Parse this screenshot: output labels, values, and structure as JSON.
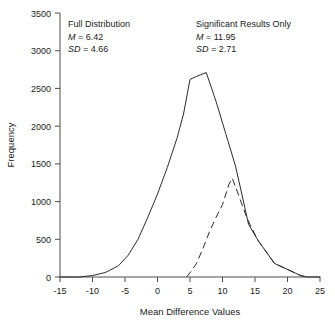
{
  "chart_data": {
    "type": "line",
    "title": "",
    "xlabel": "Mean Difference Values",
    "ylabel": "Frequency",
    "xlim": [
      -15,
      25
    ],
    "ylim": [
      0,
      3500
    ],
    "xticks": [
      "-15",
      "-10",
      "-5",
      "0",
      "5",
      "10",
      "15",
      "20",
      "25"
    ],
    "xtick_values": [
      -15,
      -10,
      -5,
      0,
      5,
      10,
      15,
      20,
      25
    ],
    "yticks": [
      "0",
      "500",
      "1000",
      "1500",
      "2000",
      "2500",
      "3000",
      "3500"
    ],
    "ytick_values": [
      0,
      500,
      1000,
      1500,
      2000,
      2500,
      3000,
      3500
    ],
    "grid": false,
    "legend_position": "none",
    "series": [
      {
        "name": "Full Distribution",
        "style": "solid",
        "x": [
          -15,
          -12,
          -10,
          -8,
          -6,
          -4.5,
          -3,
          -1.5,
          0,
          1.5,
          3,
          4,
          5,
          6,
          7.5,
          9,
          10.5,
          12,
          13,
          14,
          15.5,
          17,
          18,
          19.5,
          21,
          22,
          23,
          25
        ],
        "y": [
          0,
          0,
          20,
          60,
          150,
          290,
          500,
          790,
          1100,
          1450,
          1840,
          2160,
          2620,
          2660,
          2710,
          2330,
          1900,
          1470,
          1090,
          700,
          480,
          300,
          180,
          120,
          60,
          20,
          0,
          0
        ]
      },
      {
        "name": "Significant Results Only",
        "style": "dashed",
        "x": [
          4.5,
          5.2,
          6,
          7,
          8,
          9,
          10,
          11,
          11.5,
          12.5,
          13.5,
          14.2,
          15.5,
          17,
          18,
          19.5,
          21,
          22,
          23
        ],
        "y": [
          0,
          80,
          180,
          380,
          600,
          790,
          960,
          1230,
          1310,
          1080,
          840,
          700,
          480,
          300,
          180,
          120,
          60,
          20,
          0
        ]
      }
    ],
    "annotations": [
      {
        "id": "full-distribution",
        "heading": "Full Distribution",
        "mean_label": "M",
        "mean_eq": " = 6.42",
        "sd_label": "SD",
        "sd_eq": " = 4.66"
      },
      {
        "id": "significant-results-only",
        "heading": "Significant Results Only",
        "mean_label": "M",
        "mean_eq": " = 11.95",
        "sd_label": "SD",
        "sd_eq": " = 2.71"
      }
    ]
  },
  "colors": {
    "background": "#ffffff",
    "axis": "#4d4d4d",
    "line": "#2b2b2b",
    "text": "#1a1a1a"
  }
}
